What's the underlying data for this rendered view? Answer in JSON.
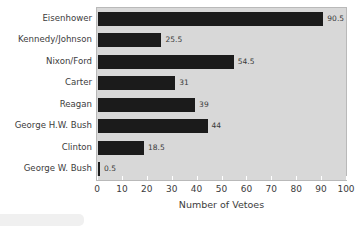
{
  "chart_data": {
    "type": "bar",
    "orientation": "horizontal",
    "title": "",
    "xlabel": "Number of Vetoes",
    "ylabel": "",
    "xlim": [
      0,
      100
    ],
    "xticks": [
      0,
      10,
      20,
      30,
      40,
      50,
      60,
      70,
      80,
      90,
      100
    ],
    "grid": false,
    "legend": null,
    "categories": [
      "Eisenhower",
      "Kennedy/Johnson",
      "Nixon/Ford",
      "Carter",
      "Reagan",
      "George H.W. Bush",
      "Clinton",
      "George W. Bush"
    ],
    "values": [
      90.5,
      25.5,
      54.5,
      31,
      39,
      44,
      18.5,
      0.5
    ],
    "value_labels": [
      "90.5",
      "25.5",
      "54.5",
      "31",
      "39",
      "44",
      "18.5",
      "0.5"
    ],
    "colors": {
      "bar": "#1b1b1b",
      "plot_background": "#d8d8d8",
      "page_background": "#ffffff",
      "text": "#3c3c3c",
      "axis_border": "#b9b9b9"
    }
  }
}
